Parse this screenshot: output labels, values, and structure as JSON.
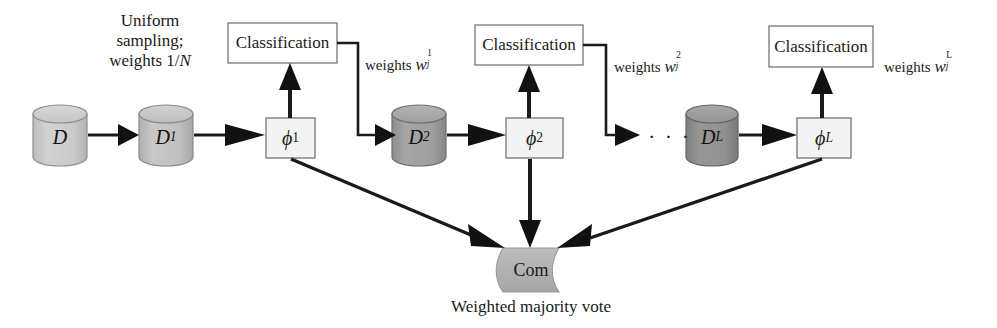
{
  "diagram": {
    "background_color": "#ffffff",
    "line_color": "#1a1a1a",
    "annotations": {
      "sampling_note_line1": "Uniform",
      "sampling_note_line2": "sampling;",
      "sampling_note_line3_prefix": "weights 1/",
      "sampling_note_line3_var": "N",
      "ellipsis": "· · ·",
      "bottom_caption": "Weighted majority vote"
    },
    "datasets": [
      {
        "id": "D",
        "label_base": "D",
        "label_sub": "",
        "fill": "#c8c8c8"
      },
      {
        "id": "D1",
        "label_base": "D",
        "label_sub": "1",
        "fill": "#bdbdbd"
      },
      {
        "id": "D2",
        "label_base": "D",
        "label_sub": "2",
        "fill": "#9a9a9a"
      },
      {
        "id": "DL",
        "label_base": "D",
        "label_sub": "L",
        "fill": "#8a8a8a"
      }
    ],
    "classifier_boxes": [
      {
        "id": "phi1",
        "label_base": "ϕ",
        "label_sub": "1",
        "fill": "#f2f2f2"
      },
      {
        "id": "phi2",
        "label_base": "ϕ",
        "label_sub": "2",
        "fill": "#f2f2f2"
      },
      {
        "id": "phiL",
        "label_base": "ϕ",
        "label_sub": "L",
        "fill": "#f2f2f2"
      }
    ],
    "classification_boxes": [
      {
        "id": "cls1",
        "label": "Classification",
        "fill": "#ffffff"
      },
      {
        "id": "cls2",
        "label": "Classification",
        "fill": "#ffffff"
      },
      {
        "id": "cls3",
        "label": "Classification",
        "fill": "#ffffff"
      }
    ],
    "weight_labels": [
      {
        "id": "w1",
        "text": "weights",
        "symbol": "w",
        "sup": "1",
        "sub": "j"
      },
      {
        "id": "w2",
        "text": "weights",
        "symbol": "w",
        "sup": "2",
        "sub": "j"
      },
      {
        "id": "wL",
        "text": "weights",
        "symbol": "w",
        "sup": "L",
        "sub": "j"
      }
    ],
    "combiner": {
      "label": "Com",
      "fill": "#b0b0b0",
      "stroke": "#8a8a8a"
    }
  }
}
